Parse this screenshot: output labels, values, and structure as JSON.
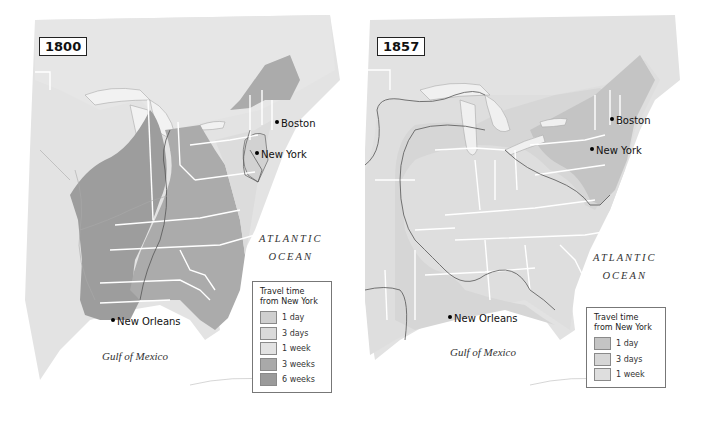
{
  "maps": [
    {
      "year": "1800",
      "cities": [
        "Boston",
        "New York",
        "New Orleans"
      ],
      "ocean_label": [
        "ATLANTIC",
        "OCEAN"
      ],
      "gulf_label": "Gulf of Mexico",
      "legend": {
        "title": "Travel time from New York",
        "items": [
          {
            "label": "1 day",
            "color": "#cfcfcf"
          },
          {
            "label": "3 days",
            "color": "#dadada"
          },
          {
            "label": "1 week",
            "color": "#e2e2e2"
          },
          {
            "label": "3 weeks",
            "color": "#a9a9a9"
          },
          {
            "label": "6 weeks",
            "color": "#9a9a9a"
          }
        ]
      }
    },
    {
      "year": "1857",
      "cities": [
        "Boston",
        "New York",
        "New Orleans"
      ],
      "ocean_label": [
        "ATLANTIC",
        "OCEAN"
      ],
      "gulf_label": "Gulf of Mexico",
      "legend": {
        "title": "Travel time from New York",
        "items": [
          {
            "label": "1 day",
            "color": "#c4c4c4"
          },
          {
            "label": "3 days",
            "color": "#d6d6d6"
          },
          {
            "label": "1 week",
            "color": "#dedede"
          }
        ]
      }
    }
  ]
}
